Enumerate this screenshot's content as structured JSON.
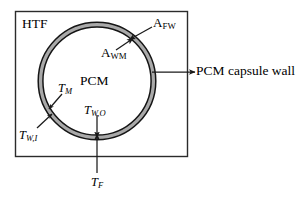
{
  "figure": {
    "type": "technical-diagram",
    "background_color": "#ffffff",
    "line_color": "#1a1a1a",
    "wall_fill_color": "#a8a8a8",
    "enclosure": {
      "name": "HTF domain box",
      "label": "HTF",
      "x": 15,
      "y": 11,
      "width": 173,
      "height": 146
    },
    "capsule": {
      "name": "PCM capsule annulus",
      "center_x": 97,
      "center_y": 81,
      "outer_radius": 59,
      "wall_thickness": 5,
      "interior_label": "PCM"
    },
    "labels": {
      "htf": "HTF",
      "pcm": "PCM",
      "area_fw": {
        "symbol": "A",
        "subscript": "FW"
      },
      "area_wm": {
        "symbol": "A",
        "subscript": "WM"
      },
      "temp_m": {
        "symbol": "T",
        "subscript": "M"
      },
      "temp_wo": {
        "symbol": "T",
        "subscript": "W,O"
      },
      "temp_wi": {
        "symbol": "T",
        "subscript": "W,I"
      },
      "temp_f": {
        "symbol": "T",
        "subscript": "F"
      },
      "capsule_wall": "PCM capsule wall"
    },
    "annotations": [
      {
        "name": "A_FW leader",
        "from": [
          152,
          27
        ],
        "to": [
          128,
          40
        ],
        "target": "outer wall surface / fluid-wall interface"
      },
      {
        "name": "A_WM leader",
        "from": [
          118,
          51
        ],
        "to": [
          133,
          38
        ],
        "target": "inner wall surface / wall-PCM interface"
      },
      {
        "name": "T_M leader",
        "from": [
          61,
          95
        ],
        "to": [
          48,
          110
        ],
        "target": "PCM melt region"
      },
      {
        "name": "T_W,O leader",
        "from": [
          97,
          117
        ],
        "to": [
          97,
          137
        ],
        "target": "outer wall bottom"
      },
      {
        "name": "T_W,I leader",
        "from": [
          38,
          130
        ],
        "to": [
          52,
          115
        ],
        "target": "inner wall lower-left"
      },
      {
        "name": "T_F leader",
        "from": [
          97,
          174
        ],
        "to": [
          97,
          135
        ],
        "target": "fluid entering capsule bottom"
      },
      {
        "name": "PCM capsule wall leader",
        "from": [
          152,
          72
        ],
        "to": [
          196,
          72
        ],
        "target": "capsule wall band"
      }
    ]
  }
}
